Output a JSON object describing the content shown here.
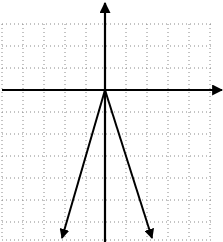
{
  "graph": {
    "description": "Coordinate grid with x and y axes and a V-shaped graph opening downward with vertex at the origin",
    "grid": {
      "style": "dotted",
      "color": "#888888",
      "vertical_lines_x": [
        2,
        23,
        44,
        65,
        86,
        126,
        147,
        168,
        189,
        210
      ],
      "horizontal_lines_y": [
        24,
        46,
        68,
        112,
        134,
        156,
        178,
        200,
        222,
        240
      ],
      "left": 2,
      "right": 212,
      "top": 24,
      "bottom": 240
    },
    "axes": {
      "color": "#000000",
      "origin": [
        105,
        90
      ],
      "x_axis": {
        "from": [
          2,
          90
        ],
        "to": [
          222,
          90
        ],
        "arrow": "right"
      },
      "y_axis": {
        "from": [
          105,
          242
        ],
        "to": [
          105,
          3
        ],
        "arrow": "up"
      }
    },
    "curves": [
      {
        "name": "left-branch",
        "from": [
          105,
          90
        ],
        "to": [
          62,
          238
        ],
        "arrow": "end"
      },
      {
        "name": "right-branch",
        "from": [
          105,
          90
        ],
        "to": [
          152,
          238
        ],
        "arrow": "end"
      }
    ]
  }
}
